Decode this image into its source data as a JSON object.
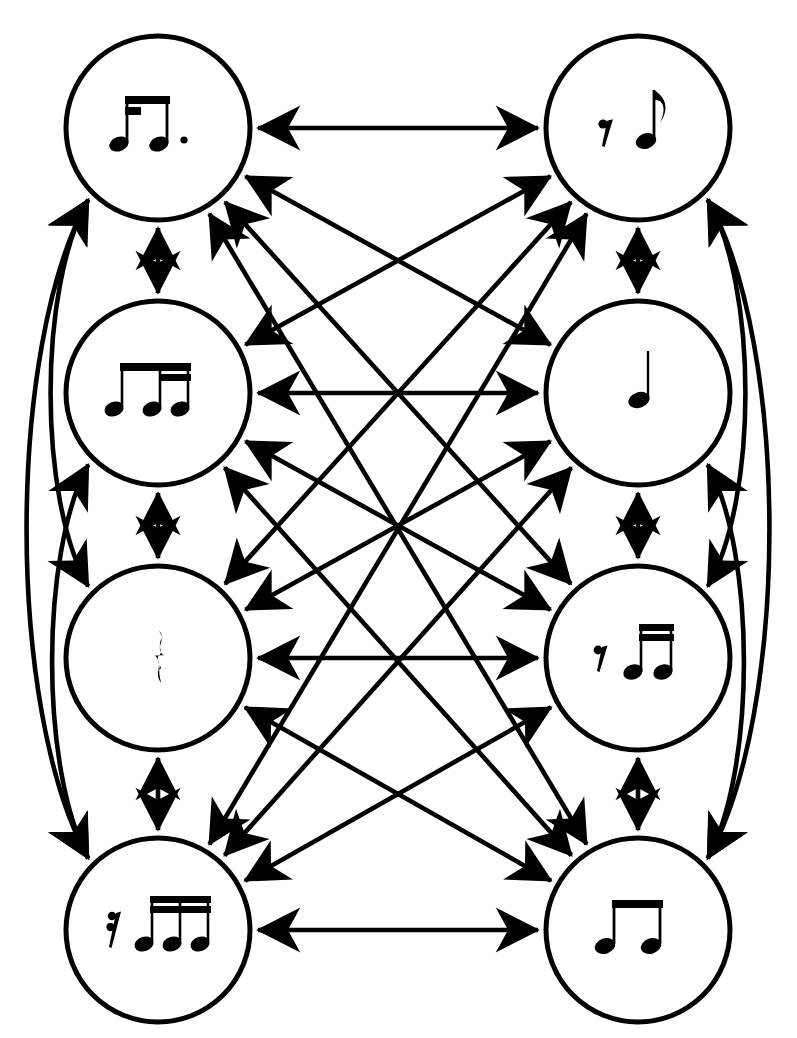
{
  "diagram": {
    "type": "complete-graph",
    "node_count": 8,
    "edge_style": "double-headed-arrow",
    "background_color": "#ffffff",
    "stroke_color": "#000000",
    "columns": 2,
    "rows": 4
  },
  "nodes": [
    {
      "id": "n1",
      "position": "top-left",
      "cx": 158,
      "cy": 128,
      "r": 92,
      "label": "dotted sixteenth and eighth note pair",
      "notation": "sixteenth-eighth-beamed-dotted",
      "elements": [
        "sixteenth-note",
        "eighth-note",
        "augmentation-dot"
      ]
    },
    {
      "id": "n2",
      "position": "top-right",
      "cx": 638,
      "cy": 128,
      "r": 92,
      "label": "eighth rest followed by eighth note",
      "notation": "eighth-rest-eighth-note",
      "elements": [
        "eighth-rest",
        "eighth-note"
      ]
    },
    {
      "id": "n3",
      "position": "upper-middle-left",
      "cx": 158,
      "cy": 393,
      "r": 92,
      "label": "eighth note and two sixteenth notes beamed",
      "notation": "eighth-two-sixteenths-beamed",
      "elements": [
        "eighth-note",
        "sixteenth-note",
        "sixteenth-note"
      ]
    },
    {
      "id": "n4",
      "position": "upper-middle-right",
      "cx": 638,
      "cy": 393,
      "r": 92,
      "label": "quarter note",
      "notation": "quarter-note",
      "elements": [
        "quarter-note"
      ]
    },
    {
      "id": "n5",
      "position": "lower-middle-left",
      "cx": 158,
      "cy": 658,
      "r": 92,
      "label": "quarter rest",
      "notation": "quarter-rest",
      "elements": [
        "quarter-rest"
      ]
    },
    {
      "id": "n6",
      "position": "lower-middle-right",
      "cx": 638,
      "cy": 658,
      "r": 92,
      "label": "sixteenth rest and two sixteenth notes beamed",
      "notation": "sixteenth-rest-two-sixteenths",
      "elements": [
        "sixteenth-rest",
        "sixteenth-note",
        "sixteenth-note"
      ]
    },
    {
      "id": "n7",
      "position": "bottom-left",
      "cx": 158,
      "cy": 930,
      "r": 92,
      "label": "thirty-second rest and three sixteenth notes beamed",
      "notation": "thirtysecond-rest-three-sixteenths",
      "elements": [
        "thirty-second-rest",
        "sixteenth-note",
        "sixteenth-note",
        "sixteenth-note"
      ]
    },
    {
      "id": "n8",
      "position": "bottom-right",
      "cx": 638,
      "cy": 930,
      "r": 92,
      "label": "two eighth notes beamed",
      "notation": "two-eighths-beamed",
      "elements": [
        "eighth-note",
        "eighth-note"
      ]
    }
  ],
  "edges": [
    {
      "from": "n1",
      "to": "n2",
      "kind": "straight",
      "direction": "bidirectional"
    },
    {
      "from": "n3",
      "to": "n4",
      "kind": "straight",
      "direction": "bidirectional"
    },
    {
      "from": "n5",
      "to": "n6",
      "kind": "straight",
      "direction": "bidirectional"
    },
    {
      "from": "n7",
      "to": "n8",
      "kind": "straight",
      "direction": "bidirectional"
    },
    {
      "from": "n1",
      "to": "n3",
      "kind": "straight",
      "direction": "bidirectional"
    },
    {
      "from": "n3",
      "to": "n5",
      "kind": "straight",
      "direction": "bidirectional"
    },
    {
      "from": "n5",
      "to": "n7",
      "kind": "straight",
      "direction": "bidirectional"
    },
    {
      "from": "n2",
      "to": "n4",
      "kind": "straight",
      "direction": "bidirectional"
    },
    {
      "from": "n4",
      "to": "n6",
      "kind": "straight",
      "direction": "bidirectional"
    },
    {
      "from": "n6",
      "to": "n8",
      "kind": "straight",
      "direction": "bidirectional"
    },
    {
      "from": "n1",
      "to": "n4",
      "kind": "diagonal",
      "direction": "bidirectional"
    },
    {
      "from": "n1",
      "to": "n6",
      "kind": "diagonal",
      "direction": "bidirectional"
    },
    {
      "from": "n1",
      "to": "n8",
      "kind": "diagonal",
      "direction": "bidirectional"
    },
    {
      "from": "n3",
      "to": "n2",
      "kind": "diagonal",
      "direction": "bidirectional"
    },
    {
      "from": "n3",
      "to": "n6",
      "kind": "diagonal",
      "direction": "bidirectional"
    },
    {
      "from": "n3",
      "to": "n8",
      "kind": "diagonal",
      "direction": "bidirectional"
    },
    {
      "from": "n5",
      "to": "n2",
      "kind": "diagonal",
      "direction": "bidirectional"
    },
    {
      "from": "n5",
      "to": "n4",
      "kind": "diagonal",
      "direction": "bidirectional"
    },
    {
      "from": "n5",
      "to": "n8",
      "kind": "diagonal",
      "direction": "bidirectional"
    },
    {
      "from": "n7",
      "to": "n2",
      "kind": "diagonal",
      "direction": "bidirectional"
    },
    {
      "from": "n7",
      "to": "n4",
      "kind": "diagonal",
      "direction": "bidirectional"
    },
    {
      "from": "n7",
      "to": "n6",
      "kind": "diagonal",
      "direction": "bidirectional"
    },
    {
      "from": "n1",
      "to": "n5",
      "kind": "curve-left-outer",
      "direction": "bidirectional"
    },
    {
      "from": "n1",
      "to": "n7",
      "kind": "curve-left-outer",
      "direction": "bidirectional"
    },
    {
      "from": "n3",
      "to": "n7",
      "kind": "curve-left-inner",
      "direction": "bidirectional"
    },
    {
      "from": "n2",
      "to": "n6",
      "kind": "curve-right-outer",
      "direction": "bidirectional"
    },
    {
      "from": "n2",
      "to": "n8",
      "kind": "curve-right-outer",
      "direction": "bidirectional"
    },
    {
      "from": "n4",
      "to": "n8",
      "kind": "curve-right-inner",
      "direction": "bidirectional"
    }
  ]
}
